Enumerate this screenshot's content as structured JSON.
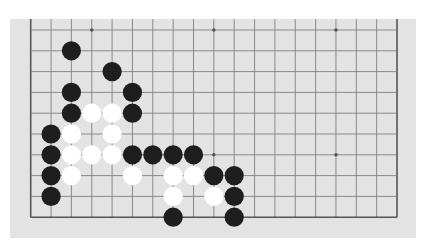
{
  "board": {
    "cols": 19,
    "rows": 10,
    "origin_x": 30.7,
    "origin_y": 30,
    "spacing_x": 20.35,
    "spacing_y": 20.8,
    "stone_radius": 9.6,
    "colors": {
      "background": "#e3e3e3",
      "grid_line": "#808080",
      "edge_line": "#555555",
      "star_point": "#555555",
      "black_stone": "#1e1e1e",
      "white_stone": "#ffffff"
    },
    "edges": {
      "left": true,
      "right": true,
      "top": false,
      "bottom": true
    },
    "star_points": [
      {
        "col": 3,
        "row": 0
      },
      {
        "col": 9,
        "row": 0
      },
      {
        "col": 15,
        "row": 0
      },
      {
        "col": 3,
        "row": 6
      },
      {
        "col": 9,
        "row": 6
      },
      {
        "col": 15,
        "row": 6
      }
    ],
    "stones": {
      "black": [
        {
          "col": 2,
          "row": 1
        },
        {
          "col": 4,
          "row": 2
        },
        {
          "col": 2,
          "row": 3
        },
        {
          "col": 5,
          "row": 3
        },
        {
          "col": 2,
          "row": 4
        },
        {
          "col": 5,
          "row": 4
        },
        {
          "col": 1,
          "row": 5
        },
        {
          "col": 1,
          "row": 6
        },
        {
          "col": 5,
          "row": 6
        },
        {
          "col": 6,
          "row": 6
        },
        {
          "col": 7,
          "row": 6
        },
        {
          "col": 8,
          "row": 6
        },
        {
          "col": 1,
          "row": 7
        },
        {
          "col": 9,
          "row": 7
        },
        {
          "col": 10,
          "row": 7
        },
        {
          "col": 1,
          "row": 8
        },
        {
          "col": 10,
          "row": 8
        },
        {
          "col": 7,
          "row": 9
        },
        {
          "col": 10,
          "row": 9
        }
      ],
      "white": [
        {
          "col": 3,
          "row": 4
        },
        {
          "col": 4,
          "row": 4
        },
        {
          "col": 2,
          "row": 5
        },
        {
          "col": 4,
          "row": 5
        },
        {
          "col": 2,
          "row": 6
        },
        {
          "col": 3,
          "row": 6
        },
        {
          "col": 4,
          "row": 6
        },
        {
          "col": 2,
          "row": 7
        },
        {
          "col": 5,
          "row": 7
        },
        {
          "col": 7,
          "row": 7
        },
        {
          "col": 8,
          "row": 7
        },
        {
          "col": 7,
          "row": 8
        },
        {
          "col": 9,
          "row": 8
        }
      ]
    }
  }
}
